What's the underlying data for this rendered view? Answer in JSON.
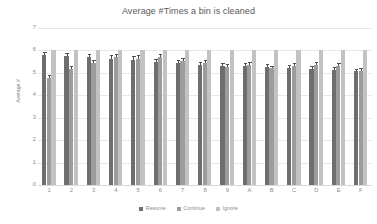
{
  "chart_data": {
    "type": "bar",
    "title": "Average #Times a bin is cleaned",
    "xlabel": "",
    "ylabel": "Average #",
    "ylim": [
      0,
      7
    ],
    "yticks": [
      0,
      1,
      2,
      3,
      4,
      5,
      6,
      7
    ],
    "grid": true,
    "legend_position": "bottom",
    "categories": [
      "1",
      "2",
      "3",
      "4",
      "5",
      "6",
      "7",
      "8",
      "9",
      "A",
      "B",
      "C",
      "D",
      "E",
      "F"
    ],
    "series": [
      {
        "name": "Resume",
        "color": "#6e6e6e",
        "values": [
          5.8,
          5.74,
          5.69,
          5.64,
          5.57,
          5.48,
          5.45,
          5.35,
          5.31,
          5.3,
          5.28,
          5.22,
          5.17,
          5.14,
          5.07
        ],
        "errors": [
          0.05,
          0.05,
          0.05,
          0.05,
          0.06,
          0.05,
          0.05,
          0.05,
          0.05,
          0.05,
          0.04,
          0.04,
          0.04,
          0.04,
          0.04
        ]
      },
      {
        "name": "Continue",
        "color": "#9c9c9c",
        "values": [
          4.76,
          5.17,
          5.45,
          5.69,
          5.64,
          5.7,
          5.52,
          5.45,
          5.26,
          5.33,
          5.2,
          5.32,
          5.35,
          5.31,
          5.1
        ],
        "errors": [
          0.06,
          0.05,
          0.05,
          0.05,
          0.06,
          0.05,
          0.05,
          0.05,
          0.05,
          0.05,
          0.04,
          0.04,
          0.04,
          0.04,
          0.04
        ]
      },
      {
        "name": "Ignore",
        "color": "#c2c2c2",
        "values": [
          6.03,
          6.03,
          6.03,
          6.03,
          6.03,
          6.03,
          6.03,
          6.03,
          6.03,
          6.03,
          6.03,
          6.03,
          6.03,
          6.03,
          6.03
        ],
        "errors": [
          0,
          0,
          0,
          0,
          0,
          0,
          0,
          0,
          0,
          0,
          0,
          0,
          0,
          0,
          0
        ]
      }
    ]
  },
  "legend": {
    "items": [
      {
        "label": "Resume"
      },
      {
        "label": "Continue"
      },
      {
        "label": "Ignore"
      }
    ]
  }
}
